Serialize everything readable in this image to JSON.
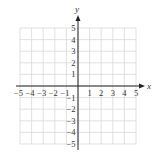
{
  "chart_data": {
    "type": "scatter",
    "title": "",
    "xlabel": "x",
    "ylabel": "y",
    "xlim": [
      -5,
      5
    ],
    "ylim": [
      -5,
      5
    ],
    "grid": true,
    "x_ticks": [
      -5,
      -4,
      -3,
      -2,
      -1,
      1,
      2,
      3,
      4,
      5
    ],
    "y_ticks": [
      5,
      4,
      3,
      2,
      1,
      -1,
      -2,
      -3,
      -4,
      -5
    ],
    "x_tick_labels": [
      "−5",
      "−4",
      "−3",
      "−2",
      "−1",
      "1",
      "2",
      "3",
      "4",
      "5"
    ],
    "y_tick_labels": [
      "5",
      "4",
      "3",
      "2",
      "1",
      "−1",
      "−2",
      "−3",
      "−4",
      "−5"
    ],
    "points": [],
    "legend": null
  },
  "colors": {
    "grid": "#d9d9d9",
    "axis": "#222222",
    "text": "#333333"
  }
}
